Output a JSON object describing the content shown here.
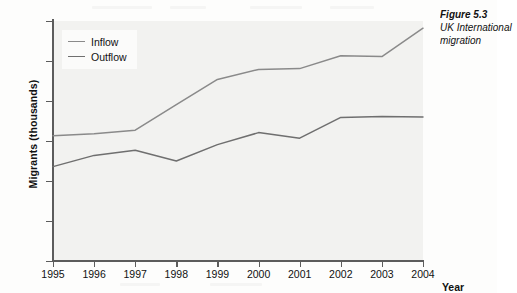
{
  "figure": {
    "caption_title": "Figure 5.3",
    "caption_line1": "UK International",
    "caption_line2": "migration"
  },
  "legend": {
    "position": "top-left-inside",
    "items": [
      {
        "label": "Inflow",
        "color": "#8a8a8a"
      },
      {
        "label": "Outflow",
        "color": "#6f6f6f"
      }
    ]
  },
  "axes": {
    "ylabel": "Migrants (thousands)",
    "xlabel": "Year",
    "yticks": [
      "0",
      "100",
      "200",
      "300",
      "400",
      "500",
      "600"
    ],
    "xticks": [
      "1995",
      "1996",
      "1997",
      "1998",
      "1999",
      "2000",
      "2001",
      "2002",
      "2003",
      "2004"
    ]
  },
  "colors": {
    "plot_background": "#f2f2f0",
    "axis": "#5c5c5c",
    "inflow": "#8a8a8a",
    "outflow": "#6f6f6f"
  },
  "chart_data": {
    "type": "line",
    "title": "UK International migration",
    "xlabel": "Year",
    "ylabel": "Migrants (thousands)",
    "x": [
      1995,
      1996,
      1997,
      1998,
      1999,
      2000,
      2001,
      2002,
      2003,
      2004
    ],
    "xlim": [
      1995,
      2004
    ],
    "ylim": [
      0,
      600
    ],
    "yticks": [
      0,
      100,
      200,
      300,
      400,
      500,
      600
    ],
    "grid": false,
    "legend_position": "upper left",
    "series": [
      {
        "name": "Inflow",
        "color": "#8a8a8a",
        "values": [
          313,
          318,
          327,
          391,
          454,
          479,
          481,
          513,
          511,
          582
        ]
      },
      {
        "name": "Outflow",
        "color": "#6f6f6f",
        "values": [
          236,
          264,
          277,
          250,
          291,
          321,
          307,
          359,
          361,
          360
        ]
      }
    ]
  }
}
